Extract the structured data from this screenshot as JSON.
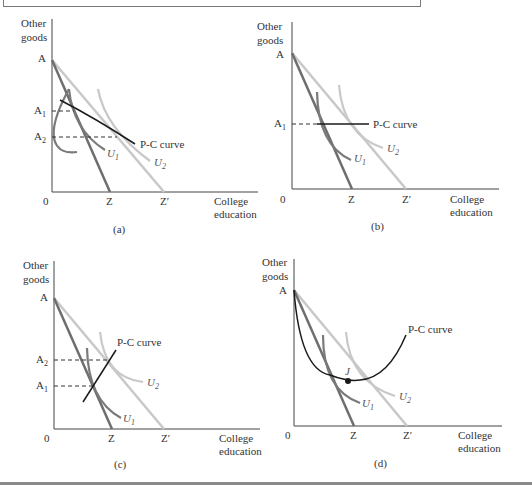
{
  "figure": {
    "panels": [
      {
        "id": "a",
        "caption": "(a)",
        "y_axis_label": [
          "Other",
          "goods"
        ],
        "x_axis_label": [
          "College",
          "education"
        ],
        "origin_label": "0",
        "intercept_label": "A",
        "budget_labels": [
          "Z",
          "Z′"
        ],
        "levels": [
          {
            "label": "A",
            "sub": "1"
          },
          {
            "label": "A",
            "sub": "2"
          }
        ],
        "indifference_curves": [
          {
            "label": "U",
            "sub": "1"
          },
          {
            "label": "U",
            "sub": "2"
          }
        ],
        "pc_curve_label": "P-C curve",
        "pc_shape": "downward-sloping"
      },
      {
        "id": "b",
        "caption": "(b)",
        "y_axis_label": [
          "Other",
          "goods"
        ],
        "x_axis_label": [
          "College",
          "education"
        ],
        "origin_label": "0",
        "intercept_label": "A",
        "budget_labels": [
          "Z",
          "Z′"
        ],
        "levels": [
          {
            "label": "A",
            "sub": "1"
          }
        ],
        "indifference_curves": [
          {
            "label": "U",
            "sub": "1"
          },
          {
            "label": "U",
            "sub": "2"
          }
        ],
        "pc_curve_label": "P-C curve",
        "pc_shape": "horizontal"
      },
      {
        "id": "c",
        "caption": "(c)",
        "y_axis_label": [
          "Other",
          "goods"
        ],
        "x_axis_label": [
          "College",
          "education"
        ],
        "origin_label": "0",
        "intercept_label": "A",
        "budget_labels": [
          "Z",
          "Z′"
        ],
        "levels": [
          {
            "label": "A",
            "sub": "2"
          },
          {
            "label": "A",
            "sub": "1"
          }
        ],
        "indifference_curves": [
          {
            "label": "U",
            "sub": "1"
          },
          {
            "label": "U",
            "sub": "2"
          }
        ],
        "pc_curve_label": "P-C curve",
        "pc_shape": "upward-sloping"
      },
      {
        "id": "d",
        "caption": "(d)",
        "y_axis_label": [
          "Other",
          "goods"
        ],
        "x_axis_label": [
          "College",
          "education"
        ],
        "origin_label": "0",
        "intercept_label": "A",
        "budget_labels": [
          "Z",
          "Z′"
        ],
        "point_label": "J",
        "indifference_curves": [
          {
            "label": "U",
            "sub": "1"
          },
          {
            "label": "U",
            "sub": "2"
          }
        ],
        "pc_curve_label": "P-C curve",
        "pc_shape": "U-shaped"
      }
    ],
    "colors": {
      "budget_original": "#6e6e6e",
      "budget_new": "#c8c8c8",
      "u1": "#7a7a7a",
      "u2": "#c8c8c8",
      "pc_curve": "#1a1a1a",
      "axis": "#444444",
      "text": "#333333"
    }
  }
}
